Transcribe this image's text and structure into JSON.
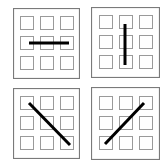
{
  "diagram": {
    "colors": {
      "background": "#ffffff",
      "border": "#7a7a7a",
      "square": "#9a9a9a",
      "line": "#000000"
    },
    "panels": [
      {
        "id": "top-left",
        "orientation": "horizontal",
        "x": 13,
        "y": 8,
        "w": 67,
        "h": 71,
        "line": {
          "x1": 16,
          "y1": 35,
          "x2": 56,
          "y2": 35
        }
      },
      {
        "id": "top-right",
        "orientation": "vertical",
        "x": 91,
        "y": 7,
        "w": 69,
        "h": 71,
        "line": {
          "x1": 34,
          "y1": 17,
          "x2": 34,
          "y2": 58
        }
      },
      {
        "id": "bottom-left",
        "orientation": "diagonal-down",
        "x": 13,
        "y": 88,
        "w": 67,
        "h": 71,
        "line": {
          "x1": 16,
          "y1": 15,
          "x2": 57,
          "y2": 57
        }
      },
      {
        "id": "bottom-right",
        "orientation": "diagonal-up",
        "x": 91,
        "y": 87,
        "w": 69,
        "h": 73,
        "line": {
          "x1": 53,
          "y1": 16,
          "x2": 14,
          "y2": 57
        }
      }
    ]
  }
}
